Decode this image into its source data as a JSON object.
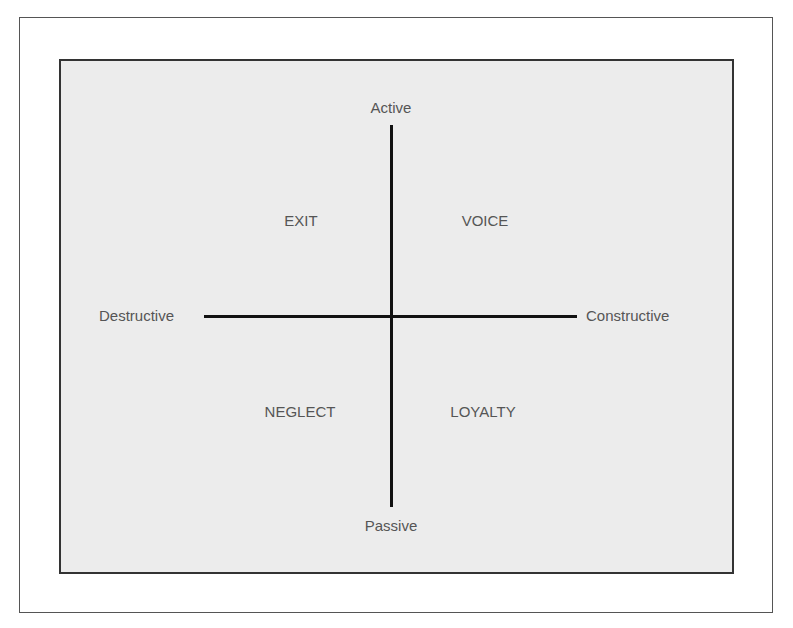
{
  "diagram": {
    "type": "quadrant",
    "axes": {
      "top": "Active",
      "bottom": "Passive",
      "left": "Destructive",
      "right": "Constructive"
    },
    "quadrants": {
      "top_left": "EXIT",
      "top_right": "VOICE",
      "bottom_left": "NEGLECT",
      "bottom_right": "LOYALTY"
    },
    "colors": {
      "panel_background": "#ececec",
      "line": "#111111",
      "text": "#555555"
    }
  }
}
